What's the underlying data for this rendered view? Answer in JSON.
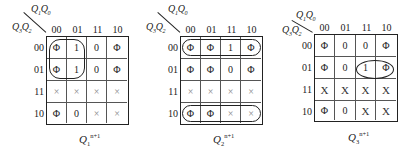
{
  "maps": [
    {
      "id": "q1",
      "top_var": "Q1Q0",
      "top_label": {
        "a": "Q",
        "a_sub": "1",
        "a_sup": "n",
        "b": "Q",
        "b_sub": "0",
        "b_sup": "n"
      },
      "left_label": {
        "a": "Q",
        "a_sub": "3",
        "a_sup": "n",
        "b": "Q",
        "b_sub": "2",
        "b_sup": "n"
      },
      "col_headers": [
        "00",
        "01",
        "11",
        "10"
      ],
      "row_headers": [
        "00",
        "01",
        "11",
        "10"
      ],
      "cells": [
        [
          "Φ",
          "1",
          "0",
          "Φ"
        ],
        [
          "Φ",
          "1",
          "0",
          "Φ"
        ],
        [
          "×",
          "×",
          "×",
          "×"
        ],
        [
          "Φ",
          "0",
          "×",
          "×"
        ]
      ],
      "caption": {
        "base": "Q",
        "sub": "1",
        "sup": "n+1"
      },
      "loops": [
        {
          "rows": [
            0,
            1
          ],
          "cols": [
            0,
            1
          ],
          "shape": "rounded-rect"
        }
      ]
    },
    {
      "id": "q2",
      "top_label": {
        "a": "Q",
        "a_sub": "1",
        "a_sup": "n",
        "b": "Q",
        "b_sub": "0",
        "b_sup": "n"
      },
      "left_label": {
        "a": "Q",
        "a_sub": "3",
        "a_sup": "n",
        "b": "Q",
        "b_sub": "2",
        "b_sup": "n"
      },
      "col_headers": [
        "00",
        "01",
        "11",
        "10"
      ],
      "row_headers": [
        "00",
        "01",
        "11",
        "10"
      ],
      "cells": [
        [
          "Φ",
          "Φ",
          "1",
          "Φ"
        ],
        [
          "Φ",
          "Φ",
          "0",
          "Φ"
        ],
        [
          "×",
          "×",
          "×",
          "×"
        ],
        [
          "Φ",
          "Φ",
          "×",
          "×"
        ]
      ],
      "caption": {
        "base": "Q",
        "sub": "2",
        "sup": "n+1"
      },
      "loops": [
        {
          "rows": [
            0
          ],
          "cols": [
            0,
            3
          ],
          "shape": "pill"
        },
        {
          "rows": [
            3
          ],
          "cols": [
            0,
            3
          ],
          "shape": "pill"
        }
      ]
    },
    {
      "id": "q3",
      "top_label": {
        "a": "Q",
        "a_sub": "1",
        "a_sup": "n",
        "b": "Q",
        "b_sub": "0",
        "b_sup": "n"
      },
      "left_label": {
        "a": "Q",
        "a_sub": "3",
        "a_sup": "n",
        "b": "Q",
        "b_sub": "2",
        "b_sup": "n"
      },
      "col_headers": [
        "00",
        "01",
        "11",
        "10"
      ],
      "row_headers": [
        "00",
        "01",
        "11",
        "10"
      ],
      "cells": [
        [
          "Φ",
          "0",
          "0",
          "Φ"
        ],
        [
          "Φ",
          "0",
          "1",
          "Φ"
        ],
        [
          "X",
          "X",
          "X",
          "X"
        ],
        [
          "Φ",
          "0",
          "X",
          "X"
        ]
      ],
      "caption": {
        "base": "Q",
        "sub": "3",
        "sup": "n+1"
      },
      "loops": [
        {
          "rows": [
            1
          ],
          "cols": [
            2,
            3
          ],
          "shape": "ellipse"
        }
      ]
    }
  ]
}
